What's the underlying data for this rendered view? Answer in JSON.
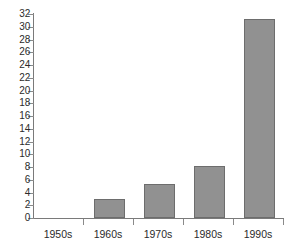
{
  "chart_data": {
    "type": "bar",
    "title": "",
    "subtitle": "",
    "xlabel": "",
    "ylabel": "",
    "categories": [
      "1950s",
      "1960s",
      "1970s",
      "1980s",
      "1990s"
    ],
    "values": [
      0,
      3,
      5.3,
      8.1,
      31.2
    ],
    "ylim": [
      0,
      32
    ],
    "ytick_step": 2,
    "ytick_labels": [
      "0",
      "2",
      "4",
      "6",
      "8",
      "10",
      "12",
      "14",
      "16",
      "18",
      "20",
      "22",
      "24",
      "26",
      "28",
      "30",
      "32"
    ],
    "grid": false,
    "legend": false,
    "legend_position": "none",
    "series": [
      {
        "name": "",
        "values": [
          0,
          3,
          5.3,
          8.1,
          31.2
        ]
      }
    ],
    "colors": {
      "bar_fill": "#919191",
      "bar_edge": "#6d6d6d",
      "axis": "#7a7a7a",
      "text": "#2b2b2b",
      "background": "#ffffff"
    }
  }
}
